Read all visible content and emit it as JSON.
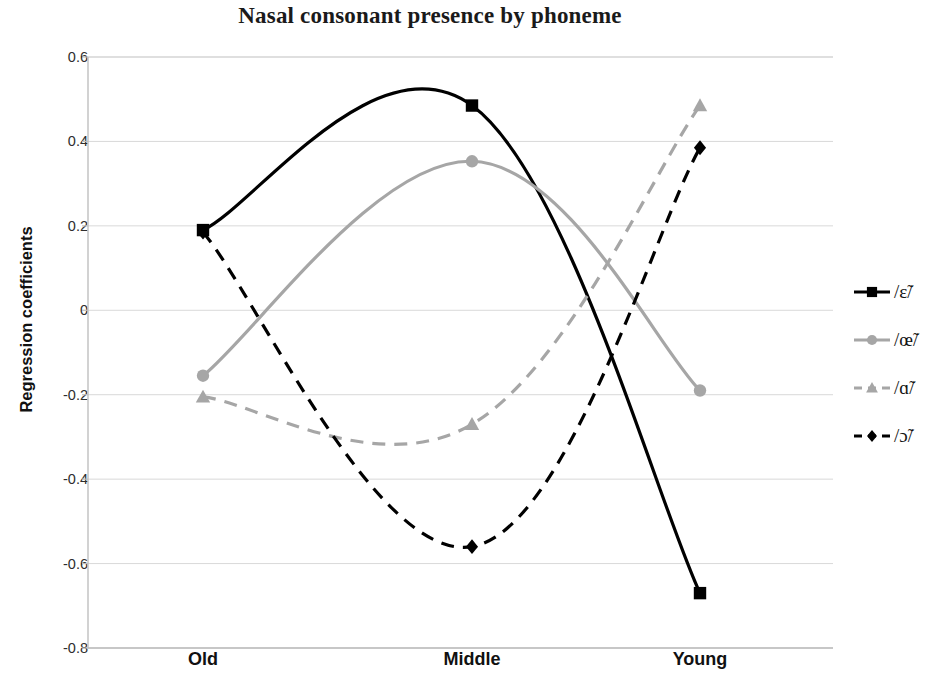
{
  "chart_data": {
    "type": "line",
    "title": "Nasal consonant presence by phoneme",
    "xlabel": "",
    "ylabel": "Regression coefficients",
    "categories": [
      "Old",
      "Middle",
      "Young"
    ],
    "ylim": [
      -0.8,
      0.6
    ],
    "yticks": [
      "0.6",
      "0.4",
      "0.2",
      "0",
      "-0.2",
      "-0.4",
      "-0.6",
      "-0.8"
    ],
    "ytick_values": [
      0.6,
      0.4,
      0.2,
      0,
      -0.2,
      -0.4,
      -0.6,
      -0.8
    ],
    "grid": true,
    "legend_position": "right",
    "smoothed": true,
    "series": [
      {
        "name": "/ɛ̃/",
        "values": [
          0.19,
          0.485,
          -0.67
        ],
        "color": "#000000",
        "marker": "square",
        "line_style": "solid",
        "line_width": 3.2
      },
      {
        "name": "/œ̃/",
        "values": [
          -0.155,
          0.353,
          -0.19
        ],
        "color": "#a6a6a6",
        "marker": "circle",
        "line_style": "solid",
        "line_width": 3.2
      },
      {
        "name": "/ɑ̃/",
        "values": [
          -0.205,
          -0.27,
          0.485
        ],
        "color": "#a6a6a6",
        "marker": "triangle",
        "line_style": "dashed",
        "line_width": 3.2
      },
      {
        "name": "/ɔ̃/",
        "values": [
          0.185,
          -0.56,
          0.385
        ],
        "color": "#000000",
        "marker": "diamond",
        "line_style": "dashed",
        "line_width": 3.2
      }
    ]
  },
  "legend": {
    "items": [
      {
        "label": "/ɛ̃/"
      },
      {
        "label": "/œ̃/"
      },
      {
        "label": "/ɑ̃/"
      },
      {
        "label": "/ɔ̃/"
      }
    ]
  },
  "colors": {
    "background": "#ffffff",
    "axis": "#bfbfbf",
    "grid": "#d9d9d9",
    "text": "#111111",
    "series_dark": "#000000",
    "series_light": "#a6a6a6"
  }
}
